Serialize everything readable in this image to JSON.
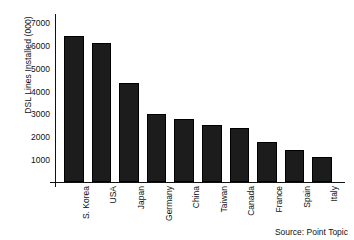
{
  "chart_data": {
    "type": "bar",
    "title": "",
    "xlabel": "",
    "ylabel": "DSL Lines Installed (000)",
    "categories": [
      "S. Korea",
      "USA",
      "Japan",
      "Germany",
      "China",
      "Taiwan",
      "Canada",
      "France",
      "Spain",
      "Italy"
    ],
    "values": [
      6400,
      6100,
      4350,
      3000,
      2750,
      2500,
      2350,
      1750,
      1400,
      1100
    ],
    "ylim": [
      0,
      7400
    ],
    "yticks": [
      1000,
      2000,
      3000,
      4000,
      5000,
      6000,
      7000
    ],
    "ytick_labels": [
      "1000",
      "2000",
      "3000",
      "4000",
      "5000",
      "6000",
      "7000"
    ],
    "grid": false,
    "legend": null,
    "bar_color": "#1c1c1c",
    "axis_color": "#111111",
    "background": "#ffffff",
    "annotations": [
      "Source: Point Topic"
    ]
  },
  "figure": {
    "source_note": "Source: Point Topic"
  }
}
